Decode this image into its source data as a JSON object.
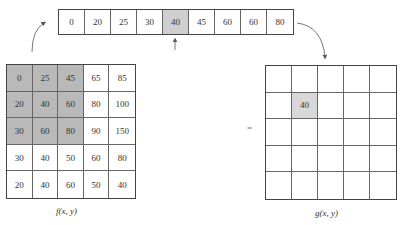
{
  "sorted_strip": {
    "values": [
      "0",
      "20",
      "25",
      "30",
      "40",
      "45",
      "60",
      "60",
      "80"
    ],
    "median_index": 4,
    "median_value": "40"
  },
  "input_image": {
    "label": "f(x, y)",
    "rows": [
      [
        "0",
        "25",
        "45",
        "65",
        "85"
      ],
      [
        "20",
        "40",
        "60",
        "80",
        "100"
      ],
      [
        "30",
        "60",
        "80",
        "90",
        "150"
      ],
      [
        "30",
        "40",
        "50",
        "60",
        "80"
      ],
      [
        "20",
        "40",
        "60",
        "50",
        "40"
      ]
    ],
    "window": {
      "rows": [
        0,
        2
      ],
      "cols": [
        0,
        2
      ]
    }
  },
  "output_image": {
    "label": "g(x, y)",
    "rows": [
      [
        "",
        "",
        "",
        "",
        ""
      ],
      [
        "",
        "40",
        "",
        "",
        ""
      ],
      [
        "",
        "",
        "",
        "",
        ""
      ],
      [
        "",
        "",
        "",
        "",
        ""
      ],
      [
        "",
        "",
        "",
        "",
        ""
      ]
    ],
    "highlight": {
      "row": 1,
      "col": 1
    }
  },
  "equals_sign": "=",
  "colors": {
    "window_shade": "#b9b9b9",
    "median_highlight": "#cfcfcf",
    "output_highlight": "#d8d8d8",
    "border": "#444444"
  }
}
